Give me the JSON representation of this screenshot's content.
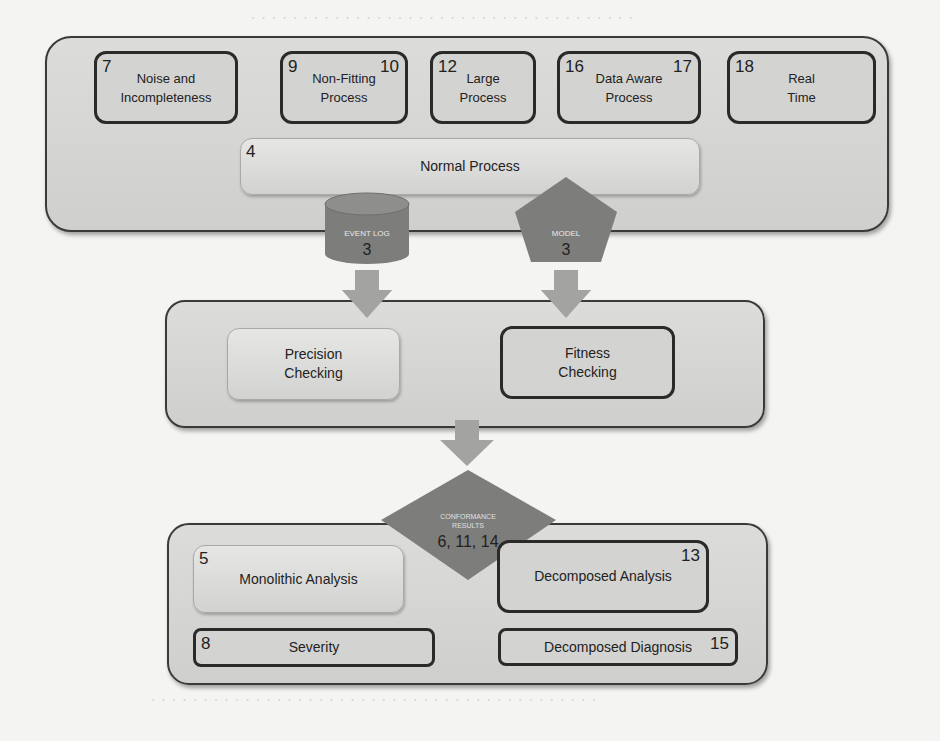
{
  "colors": {
    "container_fill": "#d5d5d3",
    "shape_fill": "#7d7d7b",
    "arrow_fill": "#a3a3a1",
    "border_dark": "#2a2a2a"
  },
  "top_group": {
    "challenges": [
      {
        "number": "7",
        "number_right": "",
        "label": "Noise and\nIncompleteness"
      },
      {
        "number": "9",
        "number_right": "10",
        "label": "Non-Fitting\nProcess"
      },
      {
        "number": "12",
        "number_right": "",
        "label": "Large\nProcess"
      },
      {
        "number": "16",
        "number_right": "17",
        "label": "Data Aware\nProcess"
      },
      {
        "number": "18",
        "number_right": "",
        "label": "Real\nTime"
      }
    ],
    "normal_process": {
      "number": "4",
      "label": "Normal Process"
    },
    "event_log": {
      "label": "EVENT LOG",
      "number": "3"
    },
    "model": {
      "label": "MODEL",
      "number": "3"
    }
  },
  "middle_group": {
    "precision": {
      "label": "Precision\nChecking"
    },
    "fitness": {
      "label": "Fitness\nChecking"
    }
  },
  "conformance_results": {
    "label": "CONFORMANCE\nRESULTS",
    "numbers": "6, 11, 14"
  },
  "bottom_group": {
    "monolithic": {
      "number": "5",
      "label": "Monolithic  Analysis"
    },
    "decomposed_analysis": {
      "number": "13",
      "label": "Decomposed Analysis"
    },
    "severity": {
      "number": "8",
      "label": "Severity"
    },
    "decomposed_diagnosis": {
      "number": "15",
      "label": "Decomposed Diagnosis"
    }
  }
}
